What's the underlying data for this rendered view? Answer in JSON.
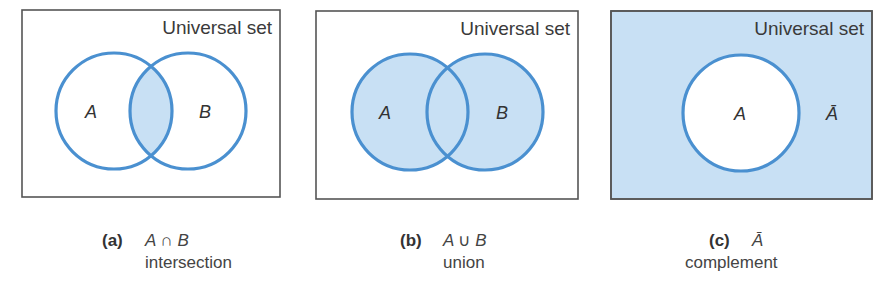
{
  "colors": {
    "stroke": "#4a90d0",
    "fill": "#c8e0f4",
    "box_border": "#555555",
    "background": "#ffffff"
  },
  "universal_label": "Universal set",
  "panels": [
    {
      "id": "a",
      "tag": "(a)",
      "expr_left": "A",
      "operator": "∩",
      "expr_right": "B",
      "word": "intersection",
      "set_labels": [
        "A",
        "B"
      ],
      "shaded_region": "intersection"
    },
    {
      "id": "b",
      "tag": "(b)",
      "expr_left": "A",
      "operator": "∪",
      "expr_right": "B",
      "word": "union",
      "set_labels": [
        "A",
        "B"
      ],
      "shaded_region": "union"
    },
    {
      "id": "c",
      "tag": "(c)",
      "expr_left": "Ā",
      "operator": "",
      "expr_right": "",
      "word": "complement",
      "set_labels": [
        "A",
        "Ā"
      ],
      "shaded_region": "complement"
    }
  ]
}
